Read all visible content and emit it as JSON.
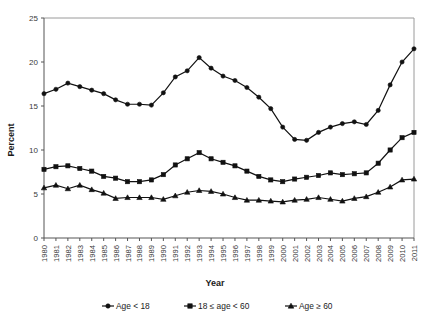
{
  "chart_data": {
    "type": "line",
    "title": "",
    "xlabel": "Year",
    "ylabel": "Percent",
    "ylim": [
      0,
      25
    ],
    "yticks": [
      0,
      5,
      10,
      15,
      20,
      25
    ],
    "grid": false,
    "legend_position": "bottom",
    "x": [
      "1980",
      "1981",
      "1982",
      "1983",
      "1984",
      "1985",
      "1986",
      "1987",
      "1988",
      "1989",
      "1990",
      "1991",
      "1992",
      "1993",
      "1994",
      "1995",
      "1996",
      "1997",
      "1998",
      "1999",
      "2000",
      "2001",
      "2002",
      "2003",
      "2004",
      "2005",
      "2006",
      "2007",
      "2008",
      "2009",
      "2010",
      "2011"
    ],
    "series": [
      {
        "name": "Age < 18",
        "marker": "circle",
        "values": [
          16.4,
          16.9,
          17.6,
          17.2,
          16.8,
          16.4,
          15.7,
          15.2,
          15.2,
          15.1,
          16.5,
          18.3,
          19.0,
          20.5,
          19.3,
          18.4,
          17.9,
          17.1,
          16.0,
          14.7,
          12.6,
          11.2,
          11.1,
          12.0,
          12.6,
          13.0,
          13.2,
          12.9,
          14.5,
          17.4,
          20.0,
          21.5
        ]
      },
      {
        "name": "18 ≤ age < 60",
        "marker": "square",
        "values": [
          7.8,
          8.1,
          8.2,
          7.9,
          7.6,
          7.0,
          6.8,
          6.4,
          6.4,
          6.6,
          7.2,
          8.3,
          9.0,
          9.7,
          9.0,
          8.6,
          8.2,
          7.6,
          7.0,
          6.6,
          6.4,
          6.7,
          6.9,
          7.1,
          7.4,
          7.2,
          7.3,
          7.4,
          8.5,
          10.0,
          11.4,
          12.0
        ]
      },
      {
        "name": "Age ≥ 60",
        "marker": "triangle",
        "values": [
          5.7,
          6.0,
          5.6,
          6.0,
          5.5,
          5.1,
          4.5,
          4.6,
          4.6,
          4.6,
          4.4,
          4.8,
          5.2,
          5.4,
          5.3,
          5.0,
          4.6,
          4.3,
          4.3,
          4.2,
          4.1,
          4.3,
          4.4,
          4.6,
          4.4,
          4.2,
          4.5,
          4.7,
          5.2,
          5.8,
          6.6,
          6.7
        ]
      }
    ]
  },
  "legend": {
    "items": [
      {
        "label": "Age < 18",
        "marker": "circle"
      },
      {
        "label": "18 ≤ age < 60",
        "marker": "square"
      },
      {
        "label": "Age ≥ 60",
        "marker": "triangle"
      }
    ]
  },
  "colors": {
    "series": "#111111",
    "axis": "#555555",
    "frame": "#9a9a9a",
    "background": "#ffffff"
  }
}
